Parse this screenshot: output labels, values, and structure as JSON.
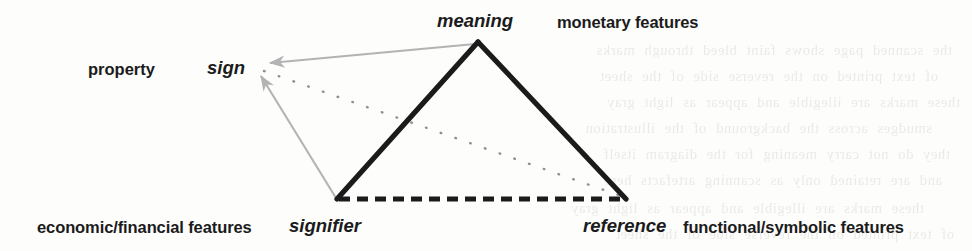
{
  "figure": {
    "kind": "semiotic-triangle-diagram",
    "background_color": "#fdfdfc",
    "ink_color": "#1b1b1b",
    "accent_gray": "#b3b3b3"
  },
  "nodes": {
    "apex": {
      "label": "meaning",
      "style": "italic"
    },
    "bottom_left": {
      "label": "signifier",
      "style": "italic"
    },
    "bottom_right": {
      "label": "reference",
      "style": "italic"
    },
    "outer_left": {
      "label": "sign",
      "style": "italic"
    }
  },
  "annotations": {
    "top_left": "property",
    "top_right": "monetary features",
    "bottom_left": "economic/financial features",
    "bottom_right": "functional/symbolic features"
  },
  "edges": [
    {
      "name": "meaning-to-signifier",
      "from": "apex",
      "to": "bottom_left",
      "style": "solid",
      "color": "#1b1b1b"
    },
    {
      "name": "meaning-to-reference",
      "from": "apex",
      "to": "bottom_right",
      "style": "solid",
      "color": "#1b1b1b"
    },
    {
      "name": "signifier-to-reference",
      "from": "bottom_left",
      "to": "bottom_right",
      "style": "dashed",
      "color": "#1b1b1b"
    },
    {
      "name": "meaning-to-sign-arrow",
      "from": "apex",
      "to": "outer_left",
      "style": "solid-arrow",
      "color": "#b3b3b3"
    },
    {
      "name": "signifier-to-sign-arrow",
      "from": "bottom_left",
      "to": "outer_left",
      "style": "solid-arrow",
      "color": "#b3b3b3"
    },
    {
      "name": "sign-to-reference-dotted",
      "from": "outer_left",
      "to": "bottom_right",
      "style": "dotted",
      "color": "#8a8a8a"
    }
  ],
  "ghost_text": [
    "the scanned page shows faint bleed through marks",
    "of text printed on the reverse side of the sheet",
    "these marks are illegible and appear as light gray",
    "smudges across the background of the illustration",
    "they do not carry meaning for the diagram itself",
    "and are retained only as scanning artefacts here"
  ]
}
